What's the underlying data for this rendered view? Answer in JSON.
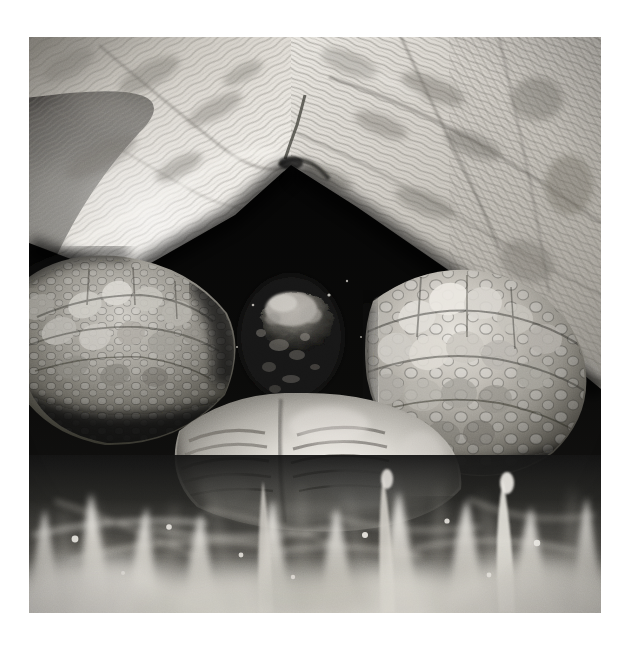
{
  "image": {
    "title": "Tortoise withdrawn into shell",
    "subject": "tortoise",
    "medium": "black-and-white photograph",
    "orientation": "square",
    "alt_text": "Close-up black and white photograph of a tortoise partially withdrawn into its shell, resting in grass",
    "canvas": {
      "width": 630,
      "height": 646,
      "background_hex": "#ffffff"
    },
    "photo_bounds": {
      "x": 29,
      "y": 37,
      "width": 572,
      "height": 576
    },
    "palette": {
      "paper_white": "#ffffff",
      "shell_highlight": "#f2f0ec",
      "shell_light": "#d8d5cf",
      "shell_mid": "#a9a59d",
      "shell_shadow": "#6f6c66",
      "cavity_black": "#070707",
      "deep_shadow": "#141414",
      "leg_scale_light": "#c9c6bf",
      "leg_scale_mid": "#8e8b84",
      "plastron_highlight": "#eceae4",
      "plastron_mid": "#b5b2ab",
      "grass_bright": "#e8e6e0",
      "grass_mid": "#9d9a93",
      "grass_dark": "#2a2a28",
      "blurred_bg": "#5d5b57"
    },
    "regions": [
      {
        "name": "blurred-background",
        "description": "out-of-focus dark grey background at upper left"
      },
      {
        "name": "carapace-left",
        "description": "left half of domed shell with striated scute growth rings"
      },
      {
        "name": "carapace-right",
        "description": "right half of domed shell with radiating scute striations"
      },
      {
        "name": "shell-apex",
        "description": "peak of the shell opening arch near centre top"
      },
      {
        "name": "shell-cavity",
        "description": "deep black opening beneath the carapace"
      },
      {
        "name": "left-foreleg",
        "description": "left front leg covered in overlapping scales and tubercles"
      },
      {
        "name": "right-foreleg",
        "description": "right front leg covered in large knobbly scales, brightly lit"
      },
      {
        "name": "head",
        "description": "tortoise head retracted deep in shadow at centre of the cavity"
      },
      {
        "name": "plastron",
        "description": "ribbed belly plates catching bright light near the bottom centre"
      },
      {
        "name": "grass-foreground",
        "description": "blurred blades of grass across the bottom of the frame"
      }
    ],
    "notes": {
      "focus": "shallow depth of field; foreground grass and background heavily blurred",
      "lighting": "strong directional light from upper left, deep shadow inside shell",
      "grain": "visible photographic grain / halftone texture"
    }
  }
}
